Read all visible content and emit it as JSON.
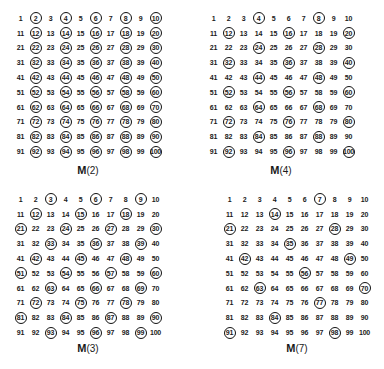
{
  "panels": [
    {
      "id": "m2",
      "title": "M",
      "arg": "(2)",
      "n": 2,
      "description": "Multiples of 2 circled"
    },
    {
      "id": "m4",
      "title": "M",
      "arg": "(4)",
      "n": 4,
      "description": "Multiples of 4 circled"
    },
    {
      "id": "m3",
      "title": "M",
      "arg": "(3)",
      "n": 3,
      "description": "Multiples of 3 circled"
    },
    {
      "id": "m7",
      "title": "M",
      "arg": "(7)",
      "n": 7,
      "description": "Multiples of 7 circled"
    }
  ],
  "grid": {
    "rows": 10,
    "cols": 10,
    "start": 1,
    "end": 100
  },
  "circled": {
    "m2": [
      2,
      4,
      6,
      8,
      10,
      12,
      14,
      16,
      18,
      20,
      22,
      24,
      26,
      28,
      30,
      32,
      34,
      36,
      38,
      40,
      42,
      44,
      46,
      48,
      50,
      52,
      54,
      56,
      58,
      60,
      62,
      64,
      66,
      68,
      70,
      72,
      74,
      76,
      78,
      80,
      82,
      84,
      86,
      88,
      90,
      92,
      94,
      96,
      98,
      100
    ],
    "m4": [
      4,
      8,
      12,
      16,
      20,
      24,
      28,
      32,
      36,
      40,
      44,
      48,
      52,
      56,
      60,
      64,
      68,
      72,
      76,
      80,
      84,
      88,
      92,
      96,
      100
    ],
    "m3": [
      3,
      6,
      9,
      12,
      15,
      18,
      21,
      24,
      27,
      30,
      33,
      36,
      39,
      42,
      45,
      48,
      51,
      54,
      57,
      60,
      63,
      66,
      69,
      72,
      75,
      78,
      81,
      84,
      87,
      90,
      93,
      96,
      99
    ],
    "m7": [
      7,
      14,
      21,
      28,
      35,
      42,
      49,
      56,
      63,
      70,
      77,
      84,
      91,
      98
    ]
  },
  "colors": {
    "ink": "#111111",
    "background": "#ffffff"
  }
}
